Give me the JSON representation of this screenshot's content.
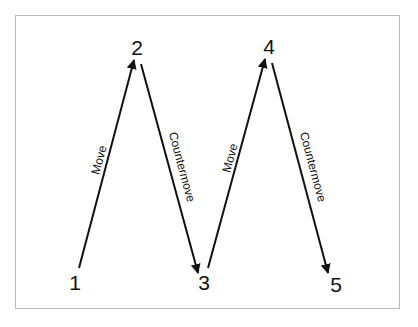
{
  "diagram": {
    "type": "zigzag-flow",
    "colors": {
      "frame_border": "#b8b8b8",
      "stroke": "#111111",
      "background": "#ffffff"
    },
    "nodes": [
      {
        "id": "1",
        "label": "1",
        "x": 75,
        "y": 290
      },
      {
        "id": "2",
        "label": "2",
        "x": 137,
        "y": 55
      },
      {
        "id": "3",
        "label": "3",
        "x": 204,
        "y": 290
      },
      {
        "id": "4",
        "label": "4",
        "x": 269,
        "y": 54
      },
      {
        "id": "5",
        "label": "5",
        "x": 336,
        "y": 292
      }
    ],
    "edges": [
      {
        "from": "1",
        "to": "2",
        "label": "Move",
        "x1": 79,
        "y1": 268,
        "x2": 134,
        "y2": 60,
        "label_x": 99,
        "label_y": 160,
        "label_angle": -75
      },
      {
        "from": "2",
        "to": "3",
        "label": "Countermove",
        "x1": 141,
        "y1": 64,
        "x2": 198,
        "y2": 273,
        "label_x": 182,
        "label_y": 167,
        "label_angle": 75
      },
      {
        "from": "3",
        "to": "4",
        "label": "Move",
        "x1": 208,
        "y1": 268,
        "x2": 265,
        "y2": 59,
        "label_x": 230,
        "label_y": 158,
        "label_angle": -75
      },
      {
        "from": "4",
        "to": "5",
        "label": "Countermove",
        "x1": 272,
        "y1": 63,
        "x2": 328,
        "y2": 273,
        "label_x": 313,
        "label_y": 167,
        "label_angle": 75
      }
    ]
  }
}
